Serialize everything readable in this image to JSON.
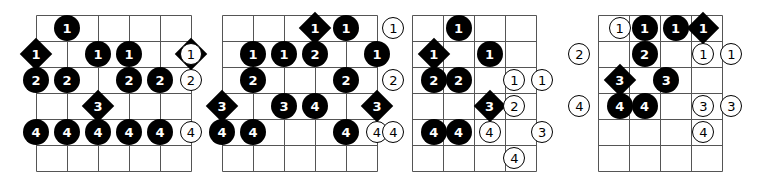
{
  "page": {
    "background_color": "#ffffff",
    "line_color": "#555555",
    "marker_fill": "#000000",
    "marker_text": "#ffffff",
    "open_marker_fill": "#ffffff",
    "open_marker_text": "#000000",
    "width": 768,
    "height": 191
  },
  "diagrams": [
    {
      "name": "fretboard-diagram-1",
      "left": 36,
      "grid": {
        "x": 0,
        "y": 15,
        "cols": 5,
        "rows": 6,
        "col_width": 31,
        "row_height": 26
      },
      "markers": [
        {
          "label": "1",
          "shape": "filled-circle",
          "col": 1,
          "row": 0
        },
        {
          "label": "1",
          "shape": "filled-diamond",
          "col": 0,
          "row": 1
        },
        {
          "label": "1",
          "shape": "filled-circle",
          "col": 2,
          "row": 1
        },
        {
          "label": "1",
          "shape": "filled-circle",
          "col": 3,
          "row": 1
        },
        {
          "label": "1",
          "shape": "filled-diamond",
          "col": 5,
          "row": 1
        },
        {
          "label": "2",
          "shape": "filled-circle",
          "col": 0,
          "row": 2
        },
        {
          "label": "2",
          "shape": "filled-circle",
          "col": 1,
          "row": 2
        },
        {
          "label": "2",
          "shape": "filled-circle",
          "col": 3,
          "row": 2
        },
        {
          "label": "2",
          "shape": "filled-circle",
          "col": 4,
          "row": 2
        },
        {
          "label": "2",
          "shape": "open-circle",
          "col": 5,
          "row": 2
        },
        {
          "label": "3",
          "shape": "filled-diamond",
          "col": 2,
          "row": 3
        },
        {
          "label": "4",
          "shape": "filled-circle",
          "col": 0,
          "row": 4
        },
        {
          "label": "4",
          "shape": "filled-circle",
          "col": 1,
          "row": 4
        },
        {
          "label": "4",
          "shape": "filled-circle",
          "col": 2,
          "row": 4
        },
        {
          "label": "4",
          "shape": "filled-circle",
          "col": 3,
          "row": 4
        },
        {
          "label": "4",
          "shape": "filled-circle",
          "col": 4,
          "row": 4
        },
        {
          "label": "4",
          "shape": "open-circle",
          "col": 5,
          "row": 4
        }
      ]
    },
    {
      "name": "fretboard-diagram-2",
      "left": 222,
      "grid": {
        "x": 0,
        "y": 15,
        "cols": 5,
        "rows": 6,
        "col_width": 31,
        "row_height": 26
      },
      "markers": [
        {
          "label": "1",
          "shape": "filled-diamond",
          "col": 3,
          "row": 0
        },
        {
          "label": "1",
          "shape": "filled-circle",
          "col": 4,
          "row": 0
        },
        {
          "label": "1",
          "shape": "open-circle",
          "col": -1,
          "row": 1
        },
        {
          "label": "1",
          "shape": "filled-circle",
          "col": 1,
          "row": 1
        },
        {
          "label": "1",
          "shape": "filled-circle",
          "col": 2,
          "row": 1
        },
        {
          "label": "2",
          "shape": "filled-circle",
          "col": 3,
          "row": 1
        },
        {
          "label": "1",
          "shape": "filled-circle",
          "col": 5,
          "row": 1
        },
        {
          "label": "2",
          "shape": "filled-circle",
          "col": 1,
          "row": 2
        },
        {
          "label": "2",
          "shape": "filled-circle",
          "col": 4,
          "row": 2
        },
        {
          "label": "3",
          "shape": "filled-diamond",
          "col": 0,
          "row": 3
        },
        {
          "label": "3",
          "shape": "filled-circle",
          "col": 2,
          "row": 3
        },
        {
          "label": "4",
          "shape": "filled-circle",
          "col": 3,
          "row": 3
        },
        {
          "label": "3",
          "shape": "filled-diamond",
          "col": 5,
          "row": 3
        },
        {
          "label": "4",
          "shape": "filled-circle",
          "col": 0,
          "row": 4
        },
        {
          "label": "4",
          "shape": "filled-circle",
          "col": 1,
          "row": 4
        },
        {
          "label": "4",
          "shape": "filled-circle",
          "col": 4,
          "row": 4
        },
        {
          "label": "4",
          "shape": "open-circle",
          "col": 5,
          "row": 4
        }
      ]
    },
    {
      "name": "fretboard-diagram-3",
      "left": 412,
      "grid": {
        "x": 0,
        "y": 15,
        "cols": 4,
        "rows": 6,
        "col_width": 31,
        "row_height": 26
      },
      "markers": [
        {
          "label": "1",
          "shape": "open-circle",
          "col": -0.6,
          "row": 0
        },
        {
          "label": "1",
          "shape": "filled-circle",
          "col": 1.5,
          "row": 0
        },
        {
          "label": "1",
          "shape": "filled-diamond",
          "col": 0.7,
          "row": 1
        },
        {
          "label": "1",
          "shape": "filled-circle",
          "col": 2.5,
          "row": 1
        },
        {
          "label": "2",
          "shape": "open-circle",
          "col": -0.6,
          "row": 2
        },
        {
          "label": "2",
          "shape": "filled-circle",
          "col": 0.7,
          "row": 2
        },
        {
          "label": "2",
          "shape": "filled-circle",
          "col": 1.5,
          "row": 2
        },
        {
          "label": "1",
          "shape": "open-circle",
          "col": 3.3,
          "row": 2
        },
        {
          "label": "1",
          "shape": "open-circle",
          "col": 4.2,
          "row": 2
        },
        {
          "label": "3",
          "shape": "filled-diamond",
          "col": 2.5,
          "row": 3
        },
        {
          "label": "2",
          "shape": "open-circle",
          "col": 3.3,
          "row": 3
        },
        {
          "label": "4",
          "shape": "open-circle",
          "col": -0.6,
          "row": 4
        },
        {
          "label": "4",
          "shape": "filled-circle",
          "col": 0.7,
          "row": 4
        },
        {
          "label": "4",
          "shape": "filled-circle",
          "col": 1.5,
          "row": 4
        },
        {
          "label": "4",
          "shape": "open-circle",
          "col": 2.5,
          "row": 4
        },
        {
          "label": "3",
          "shape": "open-circle",
          "col": 4.2,
          "row": 4
        },
        {
          "label": "4",
          "shape": "open-circle",
          "col": 3.3,
          "row": 5
        }
      ]
    },
    {
      "name": "fretboard-diagram-4",
      "left": 598,
      "grid": {
        "x": 0,
        "y": 15,
        "cols": 4,
        "rows": 6,
        "col_width": 31,
        "row_height": 26
      },
      "markers": [
        {
          "label": "1",
          "shape": "open-circle",
          "col": 0.7,
          "row": 0
        },
        {
          "label": "1",
          "shape": "filled-circle",
          "col": 1.5,
          "row": 0
        },
        {
          "label": "1",
          "shape": "filled-circle",
          "col": 2.5,
          "row": 0
        },
        {
          "label": "1",
          "shape": "filled-diamond",
          "col": 3.4,
          "row": 0
        },
        {
          "label": "2",
          "shape": "open-circle",
          "col": -0.6,
          "row": 1
        },
        {
          "label": "2",
          "shape": "filled-circle",
          "col": 1.5,
          "row": 1
        },
        {
          "label": "1",
          "shape": "open-circle",
          "col": 3.4,
          "row": 1
        },
        {
          "label": "1",
          "shape": "open-circle",
          "col": 4.3,
          "row": 1
        },
        {
          "label": "3",
          "shape": "filled-diamond",
          "col": 0.7,
          "row": 2
        },
        {
          "label": "3",
          "shape": "filled-circle",
          "col": 2.2,
          "row": 2
        },
        {
          "label": "4",
          "shape": "open-circle",
          "col": -0.6,
          "row": 3
        },
        {
          "label": "4",
          "shape": "filled-circle",
          "col": 0.7,
          "row": 3
        },
        {
          "label": "4",
          "shape": "filled-circle",
          "col": 1.5,
          "row": 3
        },
        {
          "label": "3",
          "shape": "open-circle",
          "col": 3.4,
          "row": 3
        },
        {
          "label": "3",
          "shape": "open-circle",
          "col": 4.3,
          "row": 3
        },
        {
          "label": "4",
          "shape": "open-circle",
          "col": 3.4,
          "row": 4
        }
      ]
    }
  ]
}
